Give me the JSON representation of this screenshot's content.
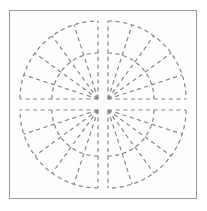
{
  "figure": {
    "background_color": "#ffffff",
    "panel_color": "#fefefe",
    "frame_border_color": "#9a9a9a",
    "stroke_color": "#8c8490",
    "stroke_width": 1.2,
    "dash_pattern": "4.2 3.4",
    "canvas_width": 186,
    "canvas_height": 187,
    "center_gap": 6
  },
  "chart_data": {
    "type": "diagram",
    "xlabel": "",
    "ylabel": "",
    "grid": false,
    "legend": "none",
    "quadrant_count": 4,
    "sectors_per_quadrant": 5,
    "quadrants": [
      {
        "name": "top-left",
        "apex_label": "bottom-right corner",
        "apex_x": 88,
        "apex_y": 88,
        "radius": 78,
        "inner_radius": 46,
        "start_angle_deg": 180,
        "end_angle_deg": 270,
        "spoke_angles_deg": [
          180,
          198,
          216,
          234,
          252,
          270
        ],
        "has_inner_arc": true,
        "has_straight_edges": true
      },
      {
        "name": "top-right",
        "apex_label": "bottom-left corner",
        "apex_x": 98,
        "apex_y": 88,
        "radius": 78,
        "inner_radius": 46,
        "start_angle_deg": 270,
        "end_angle_deg": 360,
        "spoke_angles_deg": [
          270,
          288,
          306,
          324,
          342,
          360
        ],
        "has_inner_arc": true,
        "has_straight_edges": true
      },
      {
        "name": "bottom-left",
        "apex_label": "top-right corner",
        "apex_x": 88,
        "apex_y": 99,
        "radius": 78,
        "inner_radius": 46,
        "start_angle_deg": 90,
        "end_angle_deg": 180,
        "spoke_angles_deg": [
          90,
          108,
          126,
          144,
          162,
          180
        ],
        "has_inner_arc": true,
        "has_straight_edges": true
      },
      {
        "name": "bottom-right",
        "apex_label": "top-left corner",
        "apex_x": 98,
        "apex_y": 99,
        "radius": 78,
        "inner_radius": 46,
        "start_angle_deg": 0,
        "end_angle_deg": 90,
        "spoke_angles_deg": [
          0,
          18,
          36,
          54,
          72,
          90
        ],
        "has_inner_arc": true,
        "has_straight_edges": true
      }
    ]
  }
}
